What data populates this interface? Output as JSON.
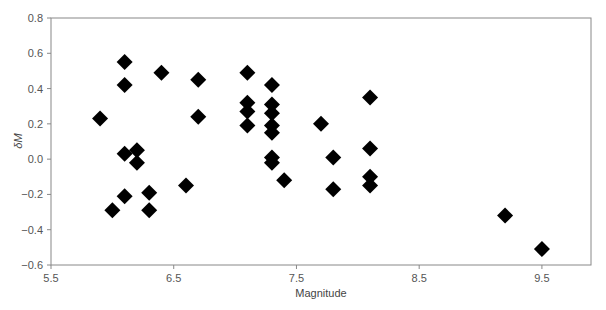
{
  "chart_data": {
    "type": "scatter",
    "title": "",
    "xlabel": "Magnitude",
    "ylabel": "δM",
    "xlim": [
      5.5,
      9.9
    ],
    "ylim": [
      -0.6,
      0.8
    ],
    "xticks": [
      5.5,
      6.5,
      7.5,
      8.5,
      9.5
    ],
    "yticks": [
      -0.6,
      -0.4,
      -0.2,
      0.0,
      0.2,
      0.4,
      0.6,
      0.8
    ],
    "ytick_labels": [
      "−0.6",
      "−0.4",
      "−0.2",
      "0.0",
      "0.2",
      "0.4",
      "0.6",
      "0.8"
    ],
    "xtick_labels": [
      "5.5",
      "6.5",
      "7.5",
      "8.5",
      "9.5"
    ],
    "grid": false,
    "legend": null,
    "marker": "diamond",
    "marker_color": "#000000",
    "points": [
      {
        "x": 5.9,
        "y": 0.23
      },
      {
        "x": 6.0,
        "y": -0.29
      },
      {
        "x": 6.1,
        "y": 0.55
      },
      {
        "x": 6.1,
        "y": 0.42
      },
      {
        "x": 6.1,
        "y": 0.03
      },
      {
        "x": 6.1,
        "y": -0.21
      },
      {
        "x": 6.2,
        "y": 0.05
      },
      {
        "x": 6.2,
        "y": -0.02
      },
      {
        "x": 6.3,
        "y": -0.19
      },
      {
        "x": 6.3,
        "y": -0.29
      },
      {
        "x": 6.4,
        "y": 0.49
      },
      {
        "x": 6.6,
        "y": -0.15
      },
      {
        "x": 6.7,
        "y": 0.45
      },
      {
        "x": 6.7,
        "y": 0.24
      },
      {
        "x": 7.1,
        "y": 0.49
      },
      {
        "x": 7.1,
        "y": 0.32
      },
      {
        "x": 7.1,
        "y": 0.27
      },
      {
        "x": 7.1,
        "y": 0.19
      },
      {
        "x": 7.3,
        "y": 0.42
      },
      {
        "x": 7.3,
        "y": 0.31
      },
      {
        "x": 7.3,
        "y": 0.26
      },
      {
        "x": 7.3,
        "y": 0.19
      },
      {
        "x": 7.3,
        "y": 0.15
      },
      {
        "x": 7.3,
        "y": 0.01
      },
      {
        "x": 7.3,
        "y": -0.02
      },
      {
        "x": 7.4,
        "y": -0.12
      },
      {
        "x": 7.7,
        "y": 0.2
      },
      {
        "x": 7.8,
        "y": 0.01
      },
      {
        "x": 7.8,
        "y": -0.17
      },
      {
        "x": 8.1,
        "y": 0.35
      },
      {
        "x": 8.1,
        "y": 0.06
      },
      {
        "x": 8.1,
        "y": -0.1
      },
      {
        "x": 8.1,
        "y": -0.15
      },
      {
        "x": 9.2,
        "y": -0.32
      },
      {
        "x": 9.5,
        "y": -0.51
      }
    ]
  }
}
